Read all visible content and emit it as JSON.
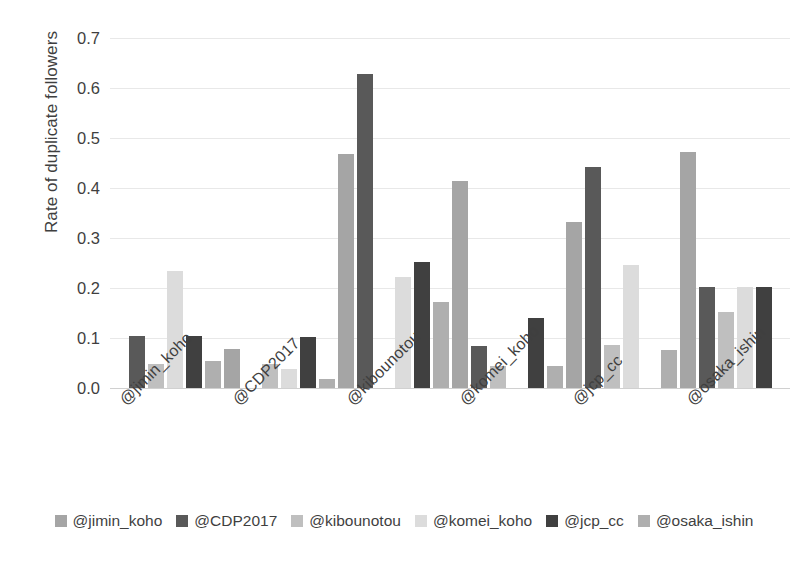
{
  "chart_data": {
    "type": "bar",
    "title": "",
    "subtitle": "",
    "xlabel": "",
    "ylabel": "Rate of duplicate followers",
    "ylim": [
      0.0,
      0.7
    ],
    "ytick_labels": [
      "0.0",
      "0.1",
      "0.2",
      "0.3",
      "0.4",
      "0.5",
      "0.6",
      "0.7"
    ],
    "ytick_values": [
      0.0,
      0.1,
      0.2,
      0.3,
      0.4,
      0.5,
      0.6,
      0.7
    ],
    "grid": true,
    "legend_position": "bottom",
    "categories": [
      "@jimin_koho",
      "@CDP2017",
      "@kibounotou",
      "@komei_koho",
      "@jcp_cc",
      "@osaka_ishin"
    ],
    "series": [
      {
        "name": "@jimin_koho",
        "color": "#A5A5A5",
        "values": [
          null,
          0.078,
          0.468,
          0.415,
          0.332,
          0.472
        ]
      },
      {
        "name": "@CDP2017",
        "color": "#595959",
        "values": [
          0.105,
          null,
          0.628,
          0.085,
          0.442,
          0.202
        ]
      },
      {
        "name": "@kibounotou",
        "color": "#BFBFBF",
        "values": [
          0.048,
          0.048,
          null,
          0.045,
          0.087,
          0.152
        ]
      },
      {
        "name": "@komei_koho",
        "color": "#DCDCDC",
        "values": [
          0.235,
          0.038,
          0.222,
          null,
          0.247,
          0.202
        ]
      },
      {
        "name": "@jcp_cc",
        "color": "#404040",
        "values": [
          0.105,
          0.102,
          0.252,
          0.14,
          null,
          0.202
        ]
      },
      {
        "name": "@osaka_ishin",
        "color": "#AFAFAF",
        "values": [
          0.055,
          0.018,
          0.173,
          0.045,
          0.077,
          null
        ]
      }
    ]
  },
  "axis": {
    "y_title": "Rate of duplicate followers"
  },
  "legend": {
    "entries": [
      {
        "label": "@jimin_koho",
        "color": "#A5A5A5"
      },
      {
        "label": "@CDP2017",
        "color": "#595959"
      },
      {
        "label": "@kibounotou",
        "color": "#BFBFBF"
      },
      {
        "label": "@komei_koho",
        "color": "#DCDCDC"
      },
      {
        "label": "@jcp_cc",
        "color": "#404040"
      },
      {
        "label": "@osaka_ishin",
        "color": "#AFAFAF"
      }
    ]
  },
  "colors": {
    "gridline": "#E8E8E8",
    "baseline": "#D0D0D0",
    "text": "#3F3F3F",
    "background": "#FFFFFF"
  }
}
